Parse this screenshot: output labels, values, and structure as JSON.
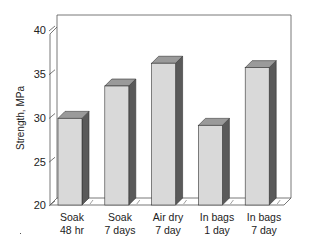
{
  "chart_data": {
    "type": "bar",
    "style": "3d-column",
    "title": "",
    "xlabel": "",
    "ylabel": "Strength, MPa",
    "ylim": [
      20,
      40
    ],
    "yticks": [
      20,
      25,
      30,
      35,
      40
    ],
    "categories": [
      "Soak 48 hr",
      "Soak 7 days",
      "Air dry 7 day",
      "In bags 1 day",
      "In bags 7 day"
    ],
    "category_lines": [
      [
        "Soak",
        "48 hr"
      ],
      [
        "Soak",
        "7 days"
      ],
      [
        "Air dry",
        "7 day"
      ],
      [
        "In bags",
        "1 day"
      ],
      [
        "In bags",
        "7 day"
      ]
    ],
    "values": [
      29.9,
      33.6,
      36.2,
      29.1,
      35.7
    ],
    "grid": false,
    "legend": null,
    "colors": {
      "bar_front": "#d9d9d9",
      "bar_top": "#9a9a9a",
      "bar_side": "#5a5a5a",
      "frame": "#555555"
    }
  },
  "axis": {
    "ylabel": "Strength, MPa",
    "ticks": [
      "40",
      "35",
      "30",
      "25",
      "20"
    ]
  }
}
